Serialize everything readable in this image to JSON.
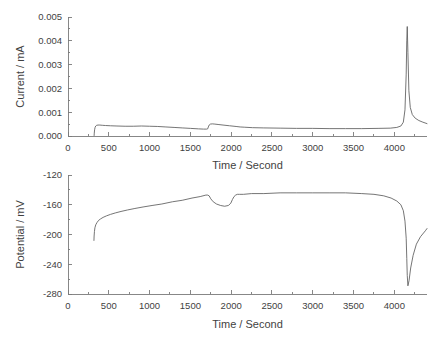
{
  "figure": {
    "background_color": "#ffffff",
    "line_color": "#5c5c5c",
    "axis_color": "#7a7a7a",
    "text_color": "#3f3f3f"
  },
  "chart_data": [
    {
      "type": "line",
      "id": "current-vs-time",
      "title": "",
      "xlabel": "Time / Second",
      "ylabel": "Current / mA",
      "xlim": [
        0,
        4400
      ],
      "ylim": [
        0.0,
        0.005
      ],
      "xticks": [
        0,
        500,
        1000,
        1500,
        2000,
        2500,
        3000,
        3500,
        4000
      ],
      "xtick_labels": [
        "0",
        "500",
        "1000",
        "1500",
        "2000",
        "2500",
        "3000",
        "3500",
        "4000"
      ],
      "yticks": [
        0.0,
        0.001,
        0.002,
        0.003,
        0.004,
        0.005
      ],
      "ytick_labels": [
        "0.000",
        "0.001",
        "0.002",
        "0.003",
        "0.004",
        "0.005"
      ],
      "grid": false,
      "legend": "none",
      "series": [
        {
          "name": "Current",
          "x": [
            320,
            322,
            326,
            332,
            340,
            352,
            368,
            390,
            420,
            460,
            520,
            600,
            700,
            800,
            900,
            1000,
            1100,
            1200,
            1300,
            1400,
            1500,
            1600,
            1660,
            1700,
            1712,
            1720,
            1730,
            1745,
            1770,
            1800,
            1850,
            1900,
            1980,
            2060,
            2110,
            2160,
            2260,
            2400,
            2600,
            2800,
            3000,
            3200,
            3400,
            3600,
            3800,
            3950,
            4030,
            4080,
            4110,
            4130,
            4145,
            4152,
            4158,
            4166,
            4178,
            4195,
            4220,
            4255,
            4300,
            4350,
            4400
          ],
          "y": [
            2e-05,
            0.00012,
            0.00026,
            0.00036,
            0.00042,
            0.00045,
            0.00046,
            0.00046,
            0.00045,
            0.00044,
            0.00043,
            0.00042,
            0.00041,
            0.00041,
            0.00042,
            0.00041,
            0.0004,
            0.00038,
            0.00036,
            0.00034,
            0.00032,
            0.0003,
            0.00029,
            0.00029,
            0.0003,
            0.00038,
            0.00046,
            0.0005,
            0.00051,
            0.0005,
            0.00048,
            0.00046,
            0.00043,
            0.0004,
            0.00038,
            0.00037,
            0.00035,
            0.00034,
            0.00033,
            0.00032,
            0.00032,
            0.00031,
            0.00031,
            0.00031,
            0.00032,
            0.00033,
            0.00036,
            0.00042,
            0.00058,
            0.0011,
            0.0026,
            0.004,
            0.0046,
            0.0035,
            0.0019,
            0.0012,
            0.0009,
            0.00075,
            0.00065,
            0.00058,
            0.00052
          ]
        }
      ]
    },
    {
      "type": "line",
      "id": "potential-vs-time",
      "title": "",
      "xlabel": "Time / Second",
      "ylabel": "Potential / mV",
      "xlim": [
        0,
        4400
      ],
      "ylim": [
        -280,
        -120
      ],
      "xticks": [
        0,
        500,
        1000,
        1500,
        2000,
        2500,
        3000,
        3500,
        4000
      ],
      "xtick_labels": [
        "0",
        "500",
        "1000",
        "1500",
        "2000",
        "2500",
        "3000",
        "3500",
        "4000"
      ],
      "yticks": [
        -280,
        -240,
        -200,
        -160,
        -120
      ],
      "ytick_labels": [
        "-280",
        "-240",
        "-200",
        "-160",
        "-120"
      ],
      "grid": false,
      "legend": "none",
      "series": [
        {
          "name": "Potential",
          "x": [
            318,
            320,
            324,
            330,
            340,
            355,
            375,
            400,
            430,
            470,
            520,
            580,
            650,
            730,
            820,
            920,
            1030,
            1150,
            1280,
            1400,
            1520,
            1620,
            1690,
            1712,
            1730,
            1750,
            1780,
            1820,
            1870,
            1920,
            1965,
            1995,
            2015,
            2035,
            2055,
            2075,
            2100,
            2150,
            2250,
            2400,
            2600,
            2800,
            3000,
            3200,
            3400,
            3600,
            3750,
            3870,
            3960,
            4030,
            4080,
            4110,
            4130,
            4145,
            4152,
            4158,
            4166,
            4180,
            4200,
            4230,
            4270,
            4320,
            4380,
            4400
          ],
          "y": [
            -208,
            -202,
            -196,
            -191,
            -187,
            -184,
            -181,
            -179,
            -177,
            -175,
            -173,
            -171,
            -169,
            -167,
            -165,
            -163,
            -161,
            -159,
            -156,
            -154,
            -151,
            -149,
            -147,
            -147,
            -148,
            -152,
            -156,
            -159,
            -161,
            -162,
            -161,
            -158,
            -153,
            -149,
            -147,
            -146,
            -146,
            -146,
            -145,
            -145,
            -144,
            -144,
            -144,
            -144,
            -144,
            -145,
            -146,
            -148,
            -151,
            -155,
            -160,
            -168,
            -182,
            -205,
            -232,
            -255,
            -269,
            -262,
            -245,
            -228,
            -213,
            -203,
            -195,
            -192
          ]
        }
      ]
    }
  ]
}
